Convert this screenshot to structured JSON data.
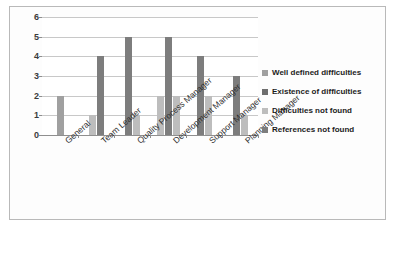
{
  "chart_data": {
    "type": "bar",
    "title": "",
    "xlabel": "",
    "ylabel": "",
    "ylim": [
      0,
      6
    ],
    "yticks": [
      "0",
      "1",
      "2",
      "3",
      "4",
      "5",
      "6"
    ],
    "grid": true,
    "legend_position": "right",
    "categories": [
      "General",
      "Team Leader",
      "Quality Process Manager",
      "Development Manager",
      "Support Manager",
      "Planning Manager"
    ],
    "series": [
      {
        "name": "Well defined difficulties",
        "color": "#a0a0a0",
        "values": [
          0,
          0,
          0,
          0,
          0,
          0
        ]
      },
      {
        "name": "Existence of difficulties",
        "color": "#6e6e6e",
        "values": [
          0,
          0,
          0,
          0,
          0,
          0
        ]
      },
      {
        "name": "Difficulties not found",
        "color": "#bdbdbd",
        "values": [
          2,
          1,
          0,
          2,
          2,
          1
        ]
      },
      {
        "name": "References not found",
        "color": "#7d7d7d",
        "values": [
          0,
          4,
          5,
          5,
          4,
          3
        ]
      }
    ],
    "bars_drawn": [
      {
        "category": "General",
        "bars": [
          {
            "series": "Difficulties not found",
            "value": 2,
            "color": "#a0a0a0"
          }
        ]
      },
      {
        "category": "Team Leader",
        "bars": [
          {
            "series": "Difficulties not found",
            "value": 1,
            "color": "#bdbdbd"
          },
          {
            "series": "References not found",
            "value": 4,
            "color": "#7d7d7d"
          }
        ]
      },
      {
        "category": "Quality Process Manager",
        "bars": [
          {
            "series": "References not found",
            "value": 5,
            "color": "#7d7d7d"
          },
          {
            "series": "Difficulties not found",
            "value": 1,
            "color": "#bdbdbd"
          }
        ]
      },
      {
        "category": "Development Manager",
        "bars": [
          {
            "series": "Difficulties not found",
            "value": 2,
            "color": "#bdbdbd"
          },
          {
            "series": "References not found",
            "value": 5,
            "color": "#7d7d7d"
          },
          {
            "series": "Difficulties not found",
            "value": 2,
            "color": "#bdbdbd"
          }
        ]
      },
      {
        "category": "Support Manager",
        "bars": [
          {
            "series": "References not found",
            "value": 4,
            "color": "#7d7d7d"
          },
          {
            "series": "Difficulties not found",
            "value": 2,
            "color": "#bdbdbd"
          }
        ]
      },
      {
        "category": "Planning Manager",
        "bars": [
          {
            "series": "References not found",
            "value": 3,
            "color": "#7d7d7d"
          },
          {
            "series": "Difficulties not found",
            "value": 1,
            "color": "#bdbdbd"
          }
        ]
      }
    ]
  }
}
